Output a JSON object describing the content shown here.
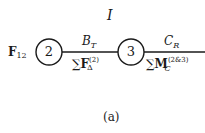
{
  "diagram": {
    "top_label": "I",
    "caption": "(a)",
    "nodes": [
      {
        "id": "2",
        "label": "2",
        "cx": 49,
        "cy": 52,
        "r": 13
      },
      {
        "id": "3",
        "label": "3",
        "cx": 131,
        "cy": 52,
        "r": 13
      }
    ],
    "edges": [
      {
        "from": "2",
        "to": "3",
        "label_above": {
          "main": "B",
          "sub": "T"
        },
        "label_below": {
          "sum": "∑",
          "main": "F",
          "sub": "Δ",
          "sup": "(2)"
        }
      },
      {
        "from": "3",
        "to": "right-edge",
        "label_above": {
          "main": "C",
          "sub": "R"
        },
        "label_below": {
          "sum": "∑",
          "main": "M",
          "sub": "C",
          "sup": "(2&3)"
        }
      }
    ],
    "input_label": {
      "main": "F",
      "sub": "12"
    },
    "colors": {
      "stroke": "#1a1a1a",
      "background": "#ffffff"
    }
  }
}
